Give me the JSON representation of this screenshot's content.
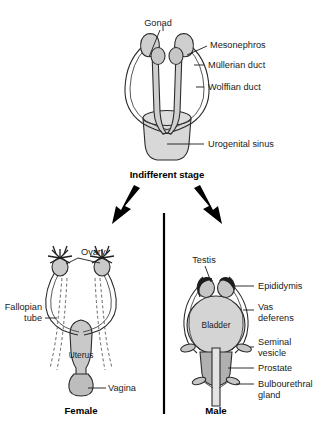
{
  "figure": {
    "title_visible": false,
    "palette": {
      "organ_light": "#d8d8d8",
      "organ_mid": "#c2c2c2",
      "organ_dark": "#a9a9a9",
      "duct_fill": "#cfcfcf",
      "outline": "#2b2b2b",
      "arrow": "#000000",
      "epididymis": "#1c1c1c",
      "background": "#ffffff"
    }
  },
  "panels": {
    "indifferent": {
      "caption": "Indifferent stage",
      "labels": [
        {
          "id": "gonad",
          "text": "Gonad"
        },
        {
          "id": "mesonephros",
          "text": "Mesonephros"
        },
        {
          "id": "mullerian-duct",
          "text": "Müllerian duct"
        },
        {
          "id": "wolffian-duct",
          "text": "Wolffian duct"
        },
        {
          "id": "urogenital-sinus",
          "text": "Urogenital sinus"
        }
      ]
    },
    "female": {
      "caption": "Female",
      "labels": [
        {
          "id": "ovary",
          "text": "Ovary"
        },
        {
          "id": "fallopian-tube",
          "text": "Fallopian"
        },
        {
          "id": "fallopian-tube-2",
          "text": "tube"
        },
        {
          "id": "uterus",
          "text": "Uterus"
        },
        {
          "id": "vagina",
          "text": "Vagina"
        }
      ]
    },
    "male": {
      "caption": "Male",
      "labels": [
        {
          "id": "testis",
          "text": "Testis"
        },
        {
          "id": "epididymis",
          "text": "Epididymis"
        },
        {
          "id": "vas-deferens",
          "text": "Vas"
        },
        {
          "id": "vas-deferens-2",
          "text": "deferens"
        },
        {
          "id": "seminal-vesicle",
          "text": "Seminal"
        },
        {
          "id": "seminal-vesicle-2",
          "text": "vesicle"
        },
        {
          "id": "prostate",
          "text": "Prostate"
        },
        {
          "id": "bulbourethral-gland",
          "text": "Bulbourethral"
        },
        {
          "id": "bulbourethral-gland-2",
          "text": "gland"
        },
        {
          "id": "bladder",
          "text": "Bladder"
        }
      ]
    }
  }
}
